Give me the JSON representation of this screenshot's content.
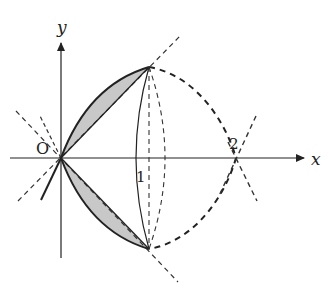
{
  "diagram": {
    "type": "coordinate-geometry-figure",
    "axes": {
      "x_label": "x",
      "y_label": "y",
      "origin_label": "O"
    },
    "tick_labels": {
      "one": "1",
      "two": "2"
    },
    "colors": {
      "stroke": "#222222",
      "shade": "#c8c8c8",
      "background": "#ffffff"
    },
    "elements": [
      "x-axis with arrow",
      "y-axis with arrow",
      "dashed line y=x",
      "dashed line y=-x",
      "shaded lens region above x-axis between O and (1,1)",
      "shaded lens region below x-axis between O and (1,-1)",
      "solid arc through (1,1) and (1,-1)",
      "dashed arc from (1,1) through (2,0) to (1,-1)",
      "dashed ellipse cross-section at x=1"
    ]
  }
}
